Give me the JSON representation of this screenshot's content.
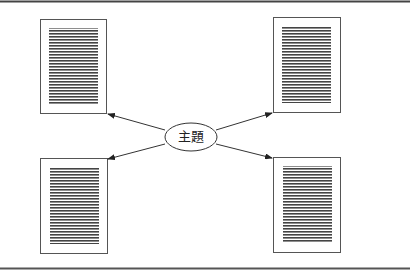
{
  "diagram": {
    "center_label": "主題",
    "documents": [
      {
        "position": "top-left",
        "lines": 30
      },
      {
        "position": "top-right",
        "lines": 30
      },
      {
        "position": "bottom-left",
        "lines": 30
      },
      {
        "position": "bottom-right",
        "lines": 30
      }
    ],
    "colors": {
      "stroke": "#333333",
      "lines": "#444444",
      "frame": "#555555"
    }
  }
}
